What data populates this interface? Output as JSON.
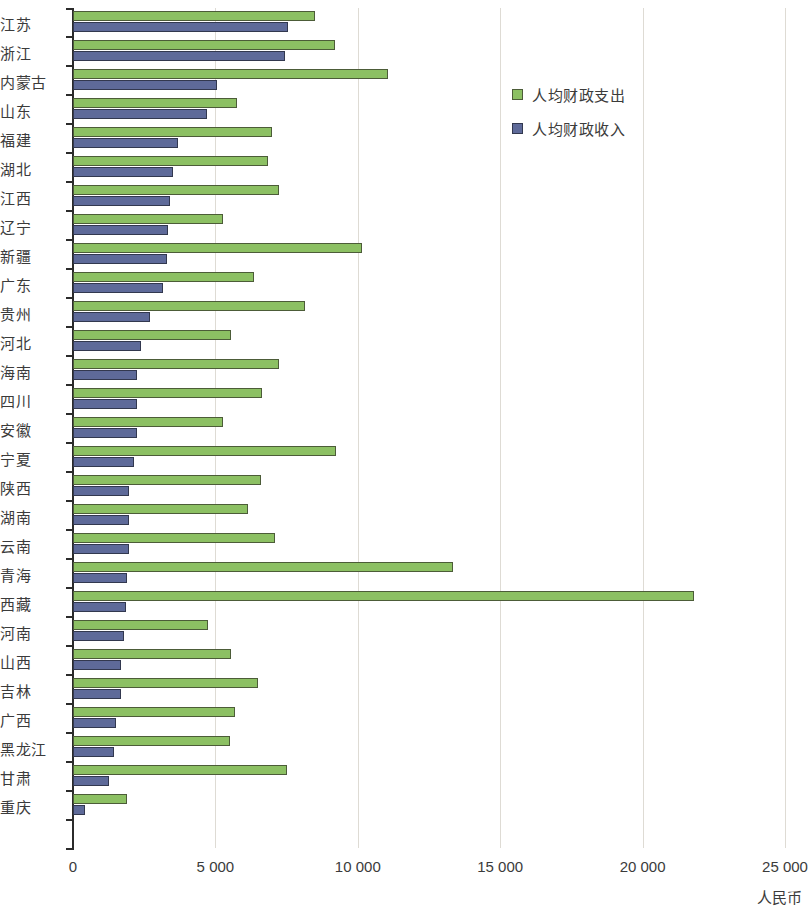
{
  "chart_data": {
    "type": "bar",
    "orientation": "horizontal",
    "title": "",
    "xlabel": "人民币",
    "ylabel": "",
    "xlim": [
      0,
      25000
    ],
    "xticks": [
      0,
      5000,
      10000,
      15000,
      20000,
      25000
    ],
    "xtick_labels": [
      "0",
      "5 000",
      "10 000",
      "15 000",
      "20 000",
      "25 000"
    ],
    "grid": true,
    "legend_position": "top-right",
    "colors": {
      "expenditure": "#8cc063",
      "revenue": "#5e6a99",
      "gridline": "#dedbd4",
      "axis": "#2b2b2b"
    },
    "categories": [
      "江苏",
      "浙江",
      "内蒙古",
      "山东",
      "福建",
      "湖北",
      "江西",
      "辽宁",
      "新疆",
      "广东",
      "贵州",
      "河北",
      "海南",
      "四川",
      "安徽",
      "宁夏",
      "陕西",
      "湖南",
      "云南",
      "青海",
      "西藏",
      "河南",
      "山西",
      "吉林",
      "广西",
      "黑龙江",
      "甘肃",
      "重庆"
    ],
    "series": [
      {
        "name": "人均财政支出",
        "color": "#8cc063",
        "values": [
          8500,
          9200,
          11050,
          5750,
          7000,
          6850,
          7250,
          5250,
          10150,
          6350,
          8150,
          5550,
          7250,
          6650,
          5250,
          9250,
          6600,
          6150,
          7100,
          13350,
          21800,
          4750,
          5550,
          6500,
          5700,
          5500,
          7500,
          1900
        ]
      },
      {
        "name": "人均财政收入",
        "color": "#5e6a99",
        "values": [
          7550,
          7450,
          5050,
          4700,
          3700,
          3500,
          3400,
          3350,
          3300,
          3150,
          2700,
          2400,
          2250,
          2250,
          2250,
          2150,
          1950,
          1950,
          1950,
          1900,
          1850,
          1800,
          1700,
          1700,
          1500,
          1450,
          1250,
          420
        ]
      }
    ]
  },
  "legend": {
    "items": [
      {
        "label": "人均财政支出",
        "color": "#8cc063"
      },
      {
        "label": "人均财政收入",
        "color": "#5e6a99"
      }
    ]
  },
  "axis": {
    "x_title": "人民币"
  }
}
